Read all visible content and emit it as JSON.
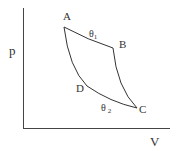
{
  "diagram": {
    "type": "pV cycle diagram",
    "axes": {
      "y_label": "p",
      "x_label": "V"
    },
    "points": [
      {
        "name": "A",
        "x": 64,
        "y": 27
      },
      {
        "name": "B",
        "x": 113,
        "y": 48
      },
      {
        "name": "C",
        "x": 137,
        "y": 108
      },
      {
        "name": "D",
        "x": 87,
        "y": 86
      }
    ],
    "point_labels": {
      "A": "A",
      "B": "B",
      "C": "C",
      "D": "D"
    },
    "isotherms": {
      "upper": {
        "label": "θ",
        "subscript": "1",
        "from": "A",
        "to": "B"
      },
      "lower": {
        "label": "θ",
        "subscript": "2",
        "from": "D",
        "to": "C"
      }
    },
    "colors": {
      "line": "#333333",
      "text": "#333333",
      "background": "#ffffff"
    }
  }
}
